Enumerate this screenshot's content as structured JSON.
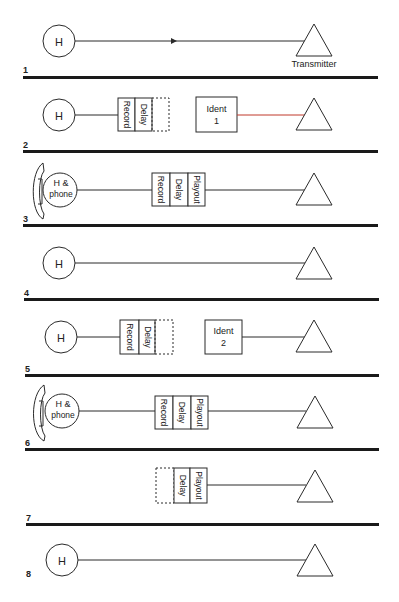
{
  "colors": {
    "stroke": "#2a2a2a",
    "separator": "#1a1a1a",
    "red_link": "#c0392b",
    "background": "#ffffff"
  },
  "labels": {
    "transmitter": "Transmitter",
    "h": "H",
    "h_phone_line1": "H &",
    "h_phone_line2": "phone",
    "record": "Record",
    "delay": "Delay",
    "playout": "Playout",
    "ident1_line1": "Ident",
    "ident1_line2": "1",
    "ident2_line1": "Ident",
    "ident2_line2": "2"
  },
  "rows": [
    {
      "number": "1",
      "description": "H connected directly to transmitter (arrow on line)"
    },
    {
      "number": "2",
      "description": "H feeds Record/Delay; Ident 1 feeds transmitter (red link)"
    },
    {
      "number": "3",
      "description": "H & phone -> Record/Delay/Playout -> transmitter"
    },
    {
      "number": "4",
      "description": "H connected directly to transmitter"
    },
    {
      "number": "5",
      "description": "H feeds Record/Delay; Ident 2 feeds transmitter"
    },
    {
      "number": "6",
      "description": "H & phone -> Record/Delay/Playout -> transmitter"
    },
    {
      "number": "7",
      "description": "Delay/Playout -> transmitter"
    },
    {
      "number": "8",
      "description": "H connected directly to transmitter"
    }
  ]
}
